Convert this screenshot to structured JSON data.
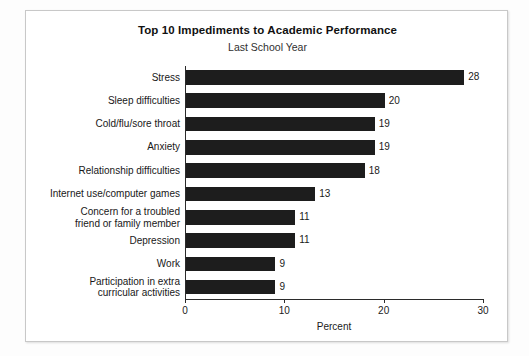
{
  "chart_data": {
    "type": "bar",
    "orientation": "horizontal",
    "title": "Top 10 Impediments to Academic Performance",
    "subtitle": "Last School Year",
    "xlabel": "Percent",
    "ylabel": "",
    "xlim": [
      0,
      30
    ],
    "xticks": [
      0,
      10,
      20,
      30
    ],
    "xtick_labels": [
      "0",
      "10",
      "20",
      "30"
    ],
    "grid": false,
    "legend": false,
    "bar_color": "#1d1d1d",
    "background_color": "#ffffff",
    "categories": [
      "Stress",
      "Sleep difficulties",
      "Cold/flu/sore throat",
      "Anxiety",
      "Relationship difficulties",
      "Internet use/computer games",
      "Concern for a troubled\nfriend or family member",
      "Depression",
      "Work",
      "Participation in extra\ncurricular activities"
    ],
    "values": [
      28,
      20,
      19,
      19,
      18,
      13,
      11,
      11,
      9,
      9
    ],
    "value_labels": [
      "28",
      "20",
      "19",
      "19",
      "18",
      "13",
      "11",
      "11",
      "9",
      "9"
    ]
  }
}
